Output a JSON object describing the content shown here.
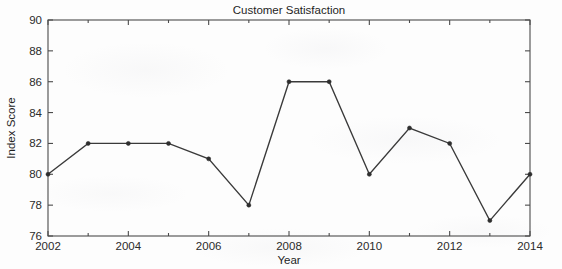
{
  "figure": {
    "background_color": "#fdfdfd",
    "plot_area": {
      "left": 48,
      "top": 20,
      "right": 530,
      "bottom": 236
    }
  },
  "chart_data": {
    "type": "line",
    "title": "Customer Satisfaction",
    "xlabel": "Year",
    "ylabel": "Index Score",
    "x": [
      2002,
      2003,
      2004,
      2005,
      2006,
      2007,
      2008,
      2009,
      2010,
      2011,
      2012,
      2013,
      2014
    ],
    "values": [
      80,
      82,
      82,
      82,
      81,
      78,
      86,
      86,
      80,
      83,
      82,
      77,
      80
    ],
    "series": [
      {
        "name": "Index Score",
        "values": [
          80,
          82,
          82,
          82,
          81,
          78,
          86,
          86,
          80,
          83,
          82,
          77,
          80
        ]
      }
    ],
    "xlim": [
      2002,
      2014
    ],
    "ylim": [
      76,
      90
    ],
    "xticks": [
      2002,
      2004,
      2006,
      2008,
      2010,
      2012,
      2014
    ],
    "xtick_labels": [
      "2002",
      "2004",
      "2006",
      "2008",
      "2010",
      "2012",
      "2014"
    ],
    "xticks_minor": [
      2003,
      2005,
      2007,
      2009,
      2011,
      2013
    ],
    "yticks": [
      76,
      78,
      80,
      82,
      84,
      86,
      88,
      90
    ],
    "ytick_labels": [
      "76",
      "78",
      "80",
      "82",
      "84",
      "86",
      "88",
      "90"
    ],
    "grid": false,
    "legend": null,
    "line_color": "#3a3a3a",
    "marker_color": "#2e2e2e",
    "marker": "point",
    "axis_color": "#4b4b4b",
    "tick_direction": "in",
    "box": true
  }
}
